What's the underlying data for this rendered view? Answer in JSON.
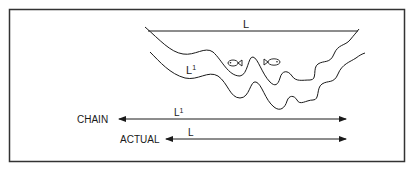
{
  "figure": {
    "type": "diagram",
    "top_line_label": "L",
    "upper_profile_label": "L",
    "upper_profile_label_sup": "1",
    "arrows": [
      {
        "name": "chain",
        "label": "CHAIN",
        "length_label": "L",
        "length_label_sup": "1"
      },
      {
        "name": "actual",
        "label": "ACTUAL",
        "length_label": "L",
        "length_label_sup": ""
      }
    ],
    "icons": [
      "fish-icon",
      "fish-icon"
    ],
    "colors": {
      "line": "#1a1a1a",
      "border": "#333333",
      "background": "#ffffff"
    }
  }
}
